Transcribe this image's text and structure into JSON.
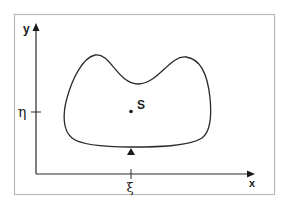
{
  "diagram": {
    "axes": {
      "x_label": "x",
      "y_label": "y"
    },
    "ticks": {
      "x_tick_label": "ξ",
      "y_tick_label": "η"
    },
    "region": {
      "point_label": "S",
      "marker": "support-triangle"
    },
    "colors": {
      "frame": "#b8b8b8",
      "ink": "#2a2a2a",
      "background": "#ffffff"
    }
  }
}
